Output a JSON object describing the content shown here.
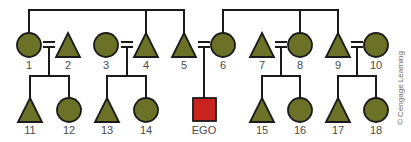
{
  "colors": {
    "female_fill": "#6b7228",
    "male_fill": "#6b7228",
    "ego_fill": "#c8231e",
    "line": "#1a1a1a"
  },
  "credit": "© Cengage Learning",
  "nodes": [
    {
      "id": "1",
      "shape": "circle",
      "x": 29,
      "y": 45
    },
    {
      "id": "2",
      "shape": "triangle",
      "x": 68,
      "y": 45
    },
    {
      "id": "3",
      "shape": "circle",
      "x": 106,
      "y": 45
    },
    {
      "id": "4",
      "shape": "triangle",
      "x": 146,
      "y": 45
    },
    {
      "id": "5",
      "shape": "triangle",
      "x": 184,
      "y": 45
    },
    {
      "id": "6",
      "shape": "circle",
      "x": 223,
      "y": 45
    },
    {
      "id": "7",
      "shape": "triangle",
      "x": 262,
      "y": 45
    },
    {
      "id": "8",
      "shape": "circle",
      "x": 300,
      "y": 45
    },
    {
      "id": "9",
      "shape": "triangle",
      "x": 338,
      "y": 45
    },
    {
      "id": "10",
      "shape": "circle",
      "x": 376,
      "y": 45
    },
    {
      "id": "11",
      "shape": "triangle",
      "x": 30,
      "y": 110
    },
    {
      "id": "12",
      "shape": "circle",
      "x": 69,
      "y": 110
    },
    {
      "id": "13",
      "shape": "triangle",
      "x": 107,
      "y": 110
    },
    {
      "id": "14",
      "shape": "circle",
      "x": 146,
      "y": 110
    },
    {
      "id": "EGO",
      "shape": "square",
      "x": 204,
      "y": 110
    },
    {
      "id": "15",
      "shape": "triangle",
      "x": 262,
      "y": 110
    },
    {
      "id": "16",
      "shape": "circle",
      "x": 300,
      "y": 110
    },
    {
      "id": "17",
      "shape": "triangle",
      "x": 338,
      "y": 110
    },
    {
      "id": "18",
      "shape": "circle",
      "x": 376,
      "y": 110
    }
  ],
  "labels": {
    "n1": "1",
    "n2": "2",
    "n3": "3",
    "n4": "4",
    "n5": "5",
    "n6": "6",
    "n7": "7",
    "n8": "8",
    "n9": "9",
    "n10": "10",
    "n11": "11",
    "n12": "12",
    "n13": "13",
    "n14": "14",
    "ego": "EGO",
    "n15": "15",
    "n16": "16",
    "n17": "17",
    "n18": "18"
  }
}
